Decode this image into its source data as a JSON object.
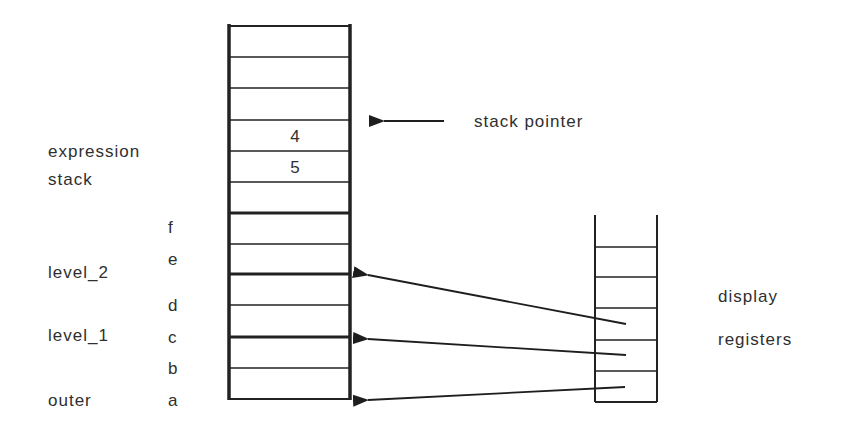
{
  "diagram": {
    "type": "stack-frame-display-registers",
    "stack": {
      "cells": [
        "",
        "",
        "",
        "4",
        "5",
        "",
        "f",
        "e",
        "d",
        "c",
        "b",
        "a"
      ],
      "cell_values": {
        "row3": "4",
        "row4": "5"
      },
      "thick_dividers_after_rows": [
        5,
        7,
        9
      ]
    },
    "labels": {
      "stack_pointer": "stack  pointer",
      "expression_line1": "expression",
      "expression_line2": "stack",
      "level_2": "level_2",
      "level_1": "level_1",
      "outer": "outer",
      "display": "display",
      "registers": "registers"
    },
    "slot_labels": {
      "f": "f",
      "e": "e",
      "d": "d",
      "c": "c",
      "b": "b",
      "a": "a"
    },
    "values": {
      "v4": "4",
      "v5": "5"
    },
    "display_registers": {
      "count": 6,
      "pointers": [
        {
          "from_register": 3,
          "to": "level_2"
        },
        {
          "from_register": 4,
          "to": "level_1"
        },
        {
          "from_register": 5,
          "to": "outer"
        }
      ]
    }
  }
}
